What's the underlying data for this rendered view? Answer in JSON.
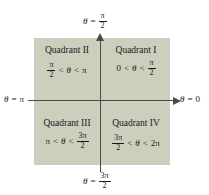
{
  "figure": {
    "colors": {
      "background": "#ffffff",
      "plane_fill": "#cdcfbd",
      "axis": "#4a4a46",
      "text": "#1a1a1a"
    }
  },
  "axis_labels": {
    "top": {
      "theta": "θ",
      "equals": "=",
      "value_numerator": "π",
      "value_denominator": "2",
      "text": "θ = π/2"
    },
    "bottom": {
      "theta": "θ",
      "equals": "=",
      "value_numerator": "3π",
      "value_denominator": "2",
      "text": "θ = 3π/2"
    },
    "left": {
      "theta": "θ",
      "equals": "=",
      "value": "π",
      "text": "θ = π"
    },
    "right": {
      "theta": "θ",
      "equals": "=",
      "value": "0",
      "text": "θ = 0"
    }
  },
  "quadrants": {
    "q1": {
      "name": "Quadrant I",
      "lower_bound": "0",
      "op_left": "<",
      "theta": "θ",
      "op_right": "<",
      "upper_numerator": "π",
      "upper_denominator": "2",
      "range_text": "0 < θ < π/2"
    },
    "q2": {
      "name": "Quadrant II",
      "lower_numerator": "π",
      "lower_denominator": "2",
      "op_left": "<",
      "theta": "θ",
      "op_right": "<",
      "upper_bound": "π",
      "range_text": "π/2 < θ < π"
    },
    "q3": {
      "name": "Quadrant III",
      "lower_bound": "π",
      "op_left": "<",
      "theta": "θ",
      "op_right": "<",
      "upper_numerator": "3π",
      "upper_denominator": "2",
      "range_text": "π < θ < 3π/2"
    },
    "q4": {
      "name": "Quadrant IV",
      "lower_numerator": "3π",
      "lower_denominator": "2",
      "op_left": "<",
      "theta": "θ",
      "op_right": "<",
      "upper_bound": "2π",
      "range_text": "3π/2 < θ < 2π"
    }
  }
}
